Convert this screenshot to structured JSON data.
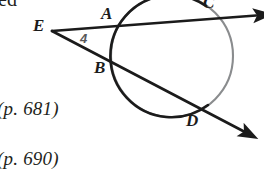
{
  "figure": {
    "type": "geometry-diagram",
    "stroke_color_dark": "#1b1b1b",
    "stroke_color_circle_light": "#808285",
    "background_color": "#ffffff",
    "point_labels": [
      {
        "name": "A",
        "text": "A",
        "x": 103,
        "y": 14
      },
      {
        "name": "C",
        "text": "C",
        "x": 204,
        "y": -2
      },
      {
        "name": "E",
        "text": "E",
        "x": 37,
        "y": 26
      },
      {
        "name": "B",
        "text": "B",
        "x": 96,
        "y": 67
      },
      {
        "name": "D",
        "text": "D",
        "x": 188,
        "y": 120
      }
    ],
    "angle_label": {
      "name": "angle-4",
      "text": "4",
      "x": 82,
      "y": 32
    },
    "circle": {
      "cx": 172,
      "cy": 56,
      "r": 61
    },
    "secant_upper": {
      "x1": 52,
      "y1": 31,
      "x2": 258,
      "y2": 15
    },
    "secant_lower": {
      "x1": 52,
      "y1": 31,
      "x2": 248,
      "y2": 134
    }
  },
  "annotations": {
    "clipped_top_text": "ed",
    "page_ref_1": "(p. 681)",
    "page_ref_2": "(p. 690)"
  }
}
